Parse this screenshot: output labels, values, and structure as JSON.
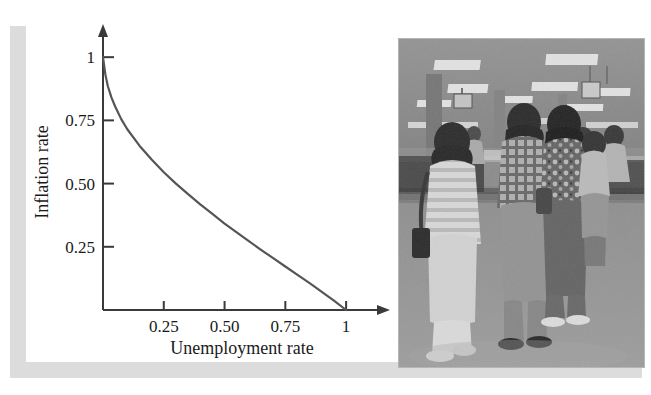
{
  "figure": {
    "panels": [
      "phillips-curve-chart",
      "unemployment-office-photograph"
    ]
  },
  "chart_data": {
    "type": "line",
    "title": "",
    "subtitle": "",
    "xlabel": "Unemployment rate",
    "ylabel": "Inflation rate",
    "xlim": [
      0,
      1.09
    ],
    "ylim": [
      0,
      1.06
    ],
    "grid": false,
    "legend": null,
    "x_ticks": [
      0.25,
      0.5,
      0.75,
      1
    ],
    "x_tick_labels": [
      "0.25",
      "0.50",
      "0.75",
      "1"
    ],
    "y_ticks": [
      0.25,
      0.5,
      0.75,
      1
    ],
    "y_tick_labels": [
      "0.25",
      "0.50",
      "0.75",
      "1"
    ],
    "series": [
      {
        "name": "Phillips curve",
        "color": "#555555",
        "x": [
          0.0,
          0.01,
          0.02,
          0.035,
          0.05,
          0.075,
          0.1,
          0.15,
          0.2,
          0.25,
          0.3,
          0.35,
          0.4,
          0.45,
          0.5,
          0.55,
          0.6,
          0.65,
          0.7,
          0.75,
          0.8,
          0.85,
          0.9,
          0.95,
          1.0
        ],
        "y": [
          1.0,
          0.93,
          0.885,
          0.84,
          0.805,
          0.755,
          0.715,
          0.65,
          0.595,
          0.545,
          0.5,
          0.458,
          0.418,
          0.38,
          0.342,
          0.307,
          0.272,
          0.238,
          0.205,
          0.172,
          0.139,
          0.106,
          0.072,
          0.037,
          0.0
        ]
      }
    ],
    "annotations": []
  },
  "photo": {
    "caption": "",
    "alt_name": "unemployment-office-photograph",
    "description_visible_text": []
  },
  "colors": {
    "curve": "#555555",
    "axis": "#3a3a3a",
    "text": "#1a1a1a",
    "shadow": "#dcdcdc",
    "page": "#ffffff"
  }
}
